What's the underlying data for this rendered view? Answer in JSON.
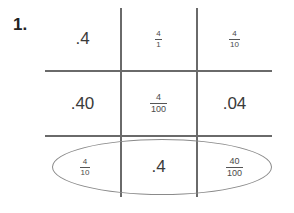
{
  "problem": {
    "number": "1."
  },
  "grid": {
    "rows": [
      [
        {
          "type": "decimal",
          "text": ".4"
        },
        {
          "type": "fraction",
          "numerator": "4",
          "denominator": "1"
        },
        {
          "type": "fraction",
          "numerator": "4",
          "denominator": "10"
        }
      ],
      [
        {
          "type": "decimal",
          "text": ".40"
        },
        {
          "type": "fraction",
          "numerator": "4",
          "denominator": "100"
        },
        {
          "type": "decimal",
          "text": ".04"
        }
      ],
      [
        {
          "type": "fraction",
          "numerator": "4",
          "denominator": "10"
        },
        {
          "type": "decimal",
          "text": ".4"
        },
        {
          "type": "fraction",
          "numerator": "40",
          "denominator": "100"
        }
      ]
    ],
    "circled_row": 3,
    "line_color": "#6a6a6a"
  }
}
